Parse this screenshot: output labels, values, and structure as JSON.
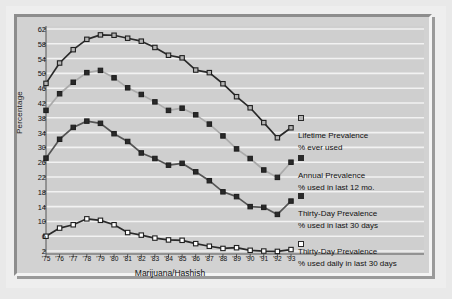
{
  "figure": {
    "y_axis_title": "Percentage",
    "x_axis_title": "Marijuana/Hashish"
  },
  "legend": {
    "entries": [
      {
        "name": "lifetime",
        "line1": "Lifetime Prevalence",
        "line2": "% ever used",
        "marker": "light-square",
        "color": "#b4b4b4"
      },
      {
        "name": "annual",
        "line1": "Annual Prevalence",
        "line2": "% used in last 12 mo.",
        "marker": "dark-square",
        "color": "#2a2a2a"
      },
      {
        "name": "thirty-day",
        "line1": "Thirty-Day Prevalence",
        "line2": "% used in last 30 days",
        "marker": "dark-square",
        "color": "#2a2a2a"
      },
      {
        "name": "daily",
        "line1": "Thirty-Day Prevalence",
        "line2": "% used daily in last 30 days",
        "marker": "white-square",
        "color": "#ffffff"
      }
    ]
  },
  "chart_data": {
    "type": "line",
    "title": "",
    "xlabel": "Marijuana/Hashish",
    "ylabel": "Percentage",
    "x": [
      "'75",
      "'76",
      "'77",
      "'78",
      "'79",
      "'80",
      "'81",
      "'82",
      "'83",
      "'84",
      "'85",
      "'86",
      "'87",
      "'88",
      "'89",
      "'90",
      "'91",
      "'92",
      "'93"
    ],
    "yticks": [
      2,
      6,
      10,
      14,
      18,
      22,
      26,
      30,
      34,
      38,
      42,
      46,
      50,
      54,
      58,
      62
    ],
    "ylim": [
      1.2,
      62.8
    ],
    "grid": "horizontal",
    "legend_position": "right",
    "series": [
      {
        "name": "Lifetime Prevalence",
        "sublabel": "% ever used",
        "marker": "light-square",
        "line_color": "#2a2a2a",
        "marker_fill": "#b4b4b4",
        "values": [
          47.3,
          52.8,
          56.4,
          59.2,
          60.4,
          60.3,
          59.5,
          58.7,
          57.0,
          54.9,
          54.2,
          50.9,
          50.2,
          47.2,
          43.7,
          40.7,
          36.7,
          32.6,
          35.3
        ]
      },
      {
        "name": "Annual Prevalence",
        "sublabel": "% used in last 12 mo.",
        "marker": "dark-square",
        "line_color": "#aaaaaa",
        "marker_fill": "#2a2a2a",
        "values": [
          40.0,
          44.5,
          47.6,
          50.2,
          50.8,
          48.8,
          46.1,
          44.3,
          42.3,
          40.0,
          40.6,
          38.8,
          36.3,
          33.1,
          29.6,
          27.0,
          23.9,
          21.9,
          26.0
        ]
      },
      {
        "name": "Thirty-Day Prevalence",
        "sublabel": "% used in last 30 days",
        "marker": "dark-square",
        "line_color": "#555555",
        "marker_fill": "#2a2a2a",
        "values": [
          27.1,
          32.2,
          35.4,
          37.1,
          36.5,
          33.7,
          31.6,
          28.5,
          27.0,
          25.2,
          25.7,
          23.4,
          21.0,
          18.0,
          16.7,
          14.0,
          13.8,
          11.9,
          15.5
        ]
      },
      {
        "name": "Thirty-Day Prevalence Daily",
        "sublabel": "% used daily in last 30 days",
        "marker": "white-square",
        "line_color": "#2a2a2a",
        "marker_fill": "#ffffff",
        "values": [
          6.0,
          8.2,
          9.1,
          10.7,
          10.3,
          9.1,
          7.0,
          6.3,
          5.5,
          5.0,
          4.9,
          4.0,
          3.3,
          2.7,
          2.9,
          2.2,
          2.0,
          1.9,
          2.4
        ]
      }
    ]
  }
}
